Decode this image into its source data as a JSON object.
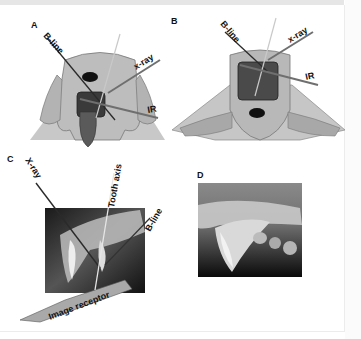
{
  "figure": {
    "panels": [
      {
        "id": "A",
        "label": "A",
        "description": "Rostral view of dog head with open mouth; x-ray beam, IR and B-line lines",
        "annotations": [
          "B-line",
          "x-ray",
          "IR"
        ]
      },
      {
        "id": "B",
        "label": "B",
        "description": "Ventral/rostral view of dog head with mandible; x-ray, IR and B-line lines",
        "annotations": [
          "B-line",
          "x-ray",
          "IR"
        ]
      },
      {
        "id": "C",
        "label": "C",
        "description": "Radiograph of canine tooth with geometry lines overlaid",
        "annotations": [
          "X-ray",
          "Tooth axis",
          "B-line",
          "Image receptor"
        ]
      },
      {
        "id": "D",
        "label": "D",
        "description": "Resulting dental radiograph of canine tooth",
        "annotations": []
      }
    ]
  },
  "labels": {
    "a": "A",
    "b": "B",
    "c": "C",
    "d": "D",
    "a_bline": "B-line",
    "a_xray": "x-ray",
    "a_ir": "IR",
    "b_bline": "B-line",
    "b_xray": "x-ray",
    "b_ir": "IR",
    "c_xray": "X-ray",
    "c_tooth_axis": "Tooth axis",
    "c_bline": "B-line",
    "c_receptor": "Image receptor"
  },
  "colors": {
    "skin": "#bdbdbd",
    "skin_dark": "#8d8d8d",
    "mouth": "#3a3a3a",
    "tongue": "#5a5a5a",
    "xray_line": "#6f6f6f",
    "bline": "#2a2a2a",
    "receptor": "#a9a9a9"
  }
}
